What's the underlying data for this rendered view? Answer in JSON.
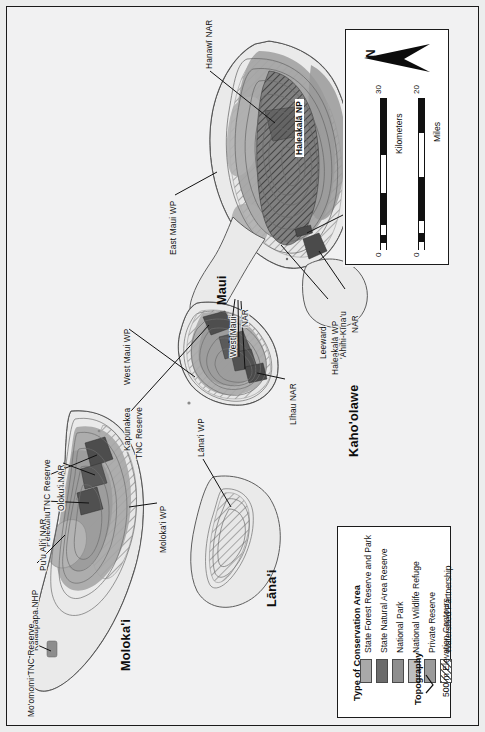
{
  "map": {
    "title": "Conservation Areas of Maui Nui",
    "background_color": "#f1f1f2",
    "rotation_note": "Map is rotated 90 degrees; north points to the right of the page.",
    "islands": [
      {
        "name": "Maui",
        "label": "Maui"
      },
      {
        "name": "Kahoolawe",
        "label": "Kaho'olawe"
      },
      {
        "name": "Lanai",
        "label": "Lāna'i"
      },
      {
        "name": "Molokai",
        "label": "Moloka'i"
      }
    ],
    "area_labels": [
      {
        "id": "hanawi-nar",
        "text": "Hanawī NAR"
      },
      {
        "id": "haleakala-np",
        "text": "Haleakalā NP"
      },
      {
        "id": "east-maui-wp",
        "text": "East Maui WP"
      },
      {
        "id": "kanaio-nar",
        "text": "Kanaio NAR"
      },
      {
        "id": "west-maui-wp",
        "text": "West Maui WP"
      },
      {
        "id": "west-maui-nar",
        "text": "West Maui\nNAR"
      },
      {
        "id": "west-maui-nar-l1",
        "text": "West Maui"
      },
      {
        "id": "west-maui-nar-l2",
        "text": "NAR"
      },
      {
        "id": "lihau-nar",
        "text": "Līhau NAR"
      },
      {
        "id": "kapunakea-tnc-l1",
        "text": "Kapunakea"
      },
      {
        "id": "kapunakea-tnc-l2",
        "text": "TNC Reserve"
      },
      {
        "id": "leeward-haleakala-l1",
        "text": "Leeward"
      },
      {
        "id": "leeward-haleakala-l2",
        "text": "Haleakalā WP"
      },
      {
        "id": "ahihi-kinau-l1",
        "text": "'Āhihi-Kīna'u"
      },
      {
        "id": "ahihi-kinau-l2",
        "text": "NAR"
      },
      {
        "id": "lanai-wp",
        "text": "Lāna'i WP"
      },
      {
        "id": "molokai-wp",
        "text": "Moloka'i WP"
      },
      {
        "id": "pelekunu-tnc",
        "text": "PelekunuTNC Reserve"
      },
      {
        "id": "olokui-nar",
        "text": "Oloku'i NAR"
      },
      {
        "id": "puu-alii-nar",
        "text": "Pu'u Ali'i NAR"
      },
      {
        "id": "kalaupapa-nhp",
        "text": "Kalaupapa NHP"
      },
      {
        "id": "moomomi-tnc",
        "text": "Mo'omomi TNC Reserve"
      }
    ]
  },
  "north_arrow": {
    "label": "N"
  },
  "scale_bars": [
    {
      "id": "kilometers",
      "unit_label": "Kilometers",
      "min_label": "0",
      "max_label": "30",
      "segments": 4
    },
    {
      "id": "miles",
      "unit_label": "Miles",
      "min_label": "0",
      "max_label": "20",
      "segments": 4
    }
  ],
  "legend": {
    "section1_title": "Type of Conservation Area",
    "items": [
      {
        "label": "State Forest Reserve and Park",
        "color": "#a9a9a9",
        "pattern": "solid"
      },
      {
        "label": "State Natural Area Reserve",
        "color": "#6b6b6b",
        "pattern": "solid"
      },
      {
        "label": "National Park",
        "color": "#8e8e8e",
        "pattern": "solid"
      },
      {
        "label": "National Wildlife Refuge",
        "color": "#bfbfbf",
        "pattern": "solid"
      },
      {
        "label": "Private Reserve",
        "color": "#9b9b9b",
        "pattern": "solid"
      },
      {
        "label": "Watershed Partnership",
        "color": "#ffffff",
        "pattern": "diagonal-hatch"
      }
    ],
    "section2_title": "Topography",
    "topography_item": {
      "label": "500 m Elevation Contours",
      "symbol": "contour-line-icon"
    }
  }
}
